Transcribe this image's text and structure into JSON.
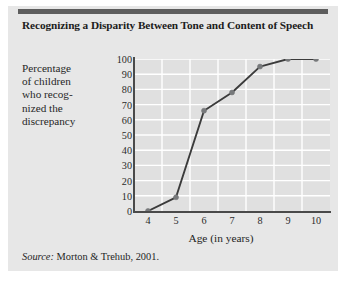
{
  "figure": {
    "title": "Recognizing a Disparity Between Tone and Content of Speech",
    "source_word": "Source:",
    "source_text": " Morton & Trehub, 2001.",
    "background_color": "#e7e7e7",
    "rule_color": "#5d5d5d"
  },
  "chart_data": {
    "type": "line",
    "title": "Recognizing a Disparity Between Tone and Content of Speech",
    "xlabel": "Age (in years)",
    "ylabel": "Percentage of children who recognized the discrepancy",
    "ylabel_lines": [
      "Percentage",
      "of children",
      "who recog-",
      "nized the",
      "discrepancy"
    ],
    "x": [
      4,
      5,
      6,
      7,
      8,
      9,
      10
    ],
    "values": [
      0,
      9,
      66,
      78,
      95,
      100,
      100
    ],
    "xticklabels": [
      "4",
      "5",
      "6",
      "7",
      "8",
      "9",
      "10"
    ],
    "yticklabels": [
      "100",
      "90",
      "80",
      "70",
      "60",
      "50",
      "40",
      "30",
      "20",
      "10",
      "0"
    ],
    "yticks": [
      100,
      90,
      80,
      70,
      60,
      50,
      40,
      30,
      20,
      10,
      0
    ],
    "xlim": [
      3.5,
      10.5
    ],
    "ylim": [
      0,
      100
    ],
    "grid": true,
    "grid_color": "#ffffff",
    "plot_background": "#e0e0e0",
    "line_color": "#3b3b3b",
    "marker_color": "#77797b",
    "marker": "circle",
    "legend": null
  }
}
